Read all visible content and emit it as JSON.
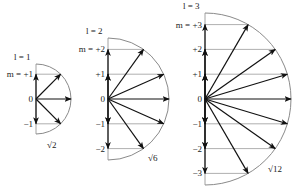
{
  "figure": {
    "colors": {
      "arrow": "#111111",
      "arc": "#8a8a8a",
      "guide_line": "#9a9a9a",
      "text": "#222222"
    },
    "unit_px": 24.8,
    "center_y": 99
  },
  "diagrams": [
    {
      "id": "l1",
      "l_label": "l = 1",
      "m_label_prefix": "m = ",
      "center_x": 36,
      "radius": 35,
      "magnitude_label": "√2",
      "m_values": [
        1,
        0,
        -1
      ],
      "m_tick_labels": [
        "+1",
        "0",
        "−1"
      ],
      "magnitude_label_pos": [
        47,
        148
      ]
    },
    {
      "id": "l2",
      "l_label": "l = 2",
      "m_label_prefix": "m = ",
      "center_x": 108,
      "radius": 61,
      "magnitude_label": "√6",
      "m_values": [
        2,
        1,
        0,
        -1,
        -2
      ],
      "m_tick_labels": [
        "+2",
        "+1",
        "0",
        "−1",
        "−2"
      ],
      "magnitude_label_pos": [
        148,
        161
      ]
    },
    {
      "id": "l3",
      "l_label": "l = 3",
      "m_label_prefix": "m = ",
      "center_x": 205,
      "radius": 86,
      "magnitude_label": "√12",
      "m_values": [
        3,
        2,
        1,
        0,
        -1,
        -2,
        -3
      ],
      "m_tick_labels": [
        "+3",
        "+2",
        "+1",
        "0",
        "−1",
        "−2",
        "−3"
      ],
      "magnitude_label_pos": [
        268,
        172
      ]
    }
  ]
}
